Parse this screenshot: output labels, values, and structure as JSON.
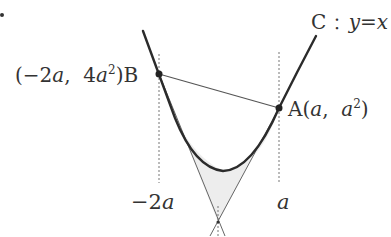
{
  "diagram": {
    "curve_label": {
      "name": "C",
      "sep": "：",
      "equation_lhs": "y",
      "eq": "=",
      "equation_rhs": "x"
    },
    "point_B": {
      "open": "(",
      "x_coef": "−2",
      "x_var": "a",
      "comma": ",",
      "y_coef": "4",
      "y_var": "a",
      "y_exp": "2",
      "close": ")",
      "name": "B"
    },
    "point_A": {
      "name": "A",
      "open": "(",
      "x_var": "a",
      "comma": ",",
      "y_var": "a",
      "y_exp": "2",
      "close": ")"
    },
    "x_labels": {
      "left_coef": "−2",
      "left_var": "a",
      "right_var": "a"
    },
    "tangent_intersection_label": "",
    "colors": {
      "curve": "#2b2b2b",
      "chord": "#555555",
      "tangent": "#666666",
      "shade": "#ececec",
      "dashed": "#777777",
      "text": "#333333"
    }
  }
}
